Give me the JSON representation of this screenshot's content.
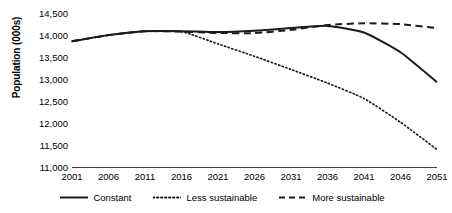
{
  "chart_data": {
    "type": "line",
    "title": "",
    "xlabel": "",
    "ylabel": "Population (000s)",
    "xlim": [
      2001,
      2051
    ],
    "ylim": [
      11000,
      14500
    ],
    "grid": false,
    "legend_position": "bottom",
    "y_ticks": [
      "14,500",
      "14,000",
      "13,500",
      "13,000",
      "12,500",
      "12,000",
      "11,500",
      "11,000"
    ],
    "y_tick_values": [
      14500,
      14000,
      13500,
      13000,
      12500,
      12000,
      11500,
      11000
    ],
    "categories": [
      "2001",
      "2006",
      "2011",
      "2016",
      "2021",
      "2026",
      "2031",
      "2036",
      "2041",
      "2046",
      "2051"
    ],
    "x": [
      2001,
      2006,
      2011,
      2016,
      2021,
      2026,
      2031,
      2036,
      2041,
      2046,
      2051
    ],
    "series": [
      {
        "name": "Constant",
        "style": "solid",
        "color": "#1a1a1a",
        "values": [
          13880,
          14020,
          14110,
          14110,
          14090,
          14120,
          14180,
          14230,
          14080,
          13630,
          12950
        ]
      },
      {
        "name": "Less sustainable",
        "style": "dotted",
        "color": "#1a1a1a",
        "values": [
          13880,
          14020,
          14110,
          14100,
          13820,
          13540,
          13240,
          12930,
          12580,
          12040,
          11420
        ]
      },
      {
        "name": "More sustainable",
        "style": "dashed",
        "color": "#1a1a1a",
        "values": [
          13880,
          14020,
          14110,
          14100,
          14070,
          14065,
          14140,
          14250,
          14290,
          14270,
          14180
        ]
      }
    ]
  },
  "axis": {
    "line_color": "#3f3f3f"
  }
}
